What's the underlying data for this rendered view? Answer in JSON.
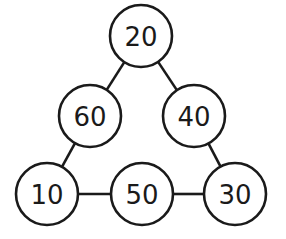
{
  "diagram": {
    "type": "triangle-number-puzzle",
    "colors": {
      "stroke": "#1a1a1a",
      "background": "#ffffff",
      "text": "#1a1a1a"
    },
    "nodes": [
      {
        "id": "top",
        "label": "20",
        "cx": 141,
        "cy": 36,
        "r": 31
      },
      {
        "id": "mid-left",
        "label": "60",
        "cx": 90,
        "cy": 116,
        "r": 31
      },
      {
        "id": "mid-right",
        "label": "40",
        "cx": 194,
        "cy": 116,
        "r": 31
      },
      {
        "id": "bottom-left",
        "label": "10",
        "cx": 47,
        "cy": 194,
        "r": 31
      },
      {
        "id": "bottom-middle",
        "label": "50",
        "cx": 142,
        "cy": 194,
        "r": 31
      },
      {
        "id": "bottom-right",
        "label": "30",
        "cx": 235,
        "cy": 194,
        "r": 31
      }
    ],
    "edges": [
      {
        "from": "top",
        "to": "mid-left"
      },
      {
        "from": "top",
        "to": "mid-right"
      },
      {
        "from": "mid-left",
        "to": "bottom-left"
      },
      {
        "from": "mid-right",
        "to": "bottom-right"
      },
      {
        "from": "bottom-left",
        "to": "bottom-middle"
      },
      {
        "from": "bottom-middle",
        "to": "bottom-right"
      }
    ]
  }
}
